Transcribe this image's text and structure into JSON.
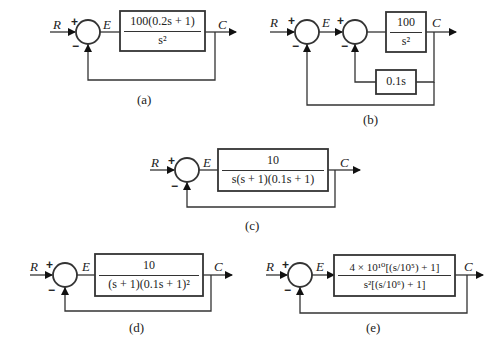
{
  "diagrams": [
    {
      "id": "a",
      "caption": "(a)",
      "input": "R",
      "error": "E",
      "output": "C",
      "plus": "+",
      "minus": "−",
      "forward": {
        "num": "100(0.2s + 1)",
        "den": "s²"
      }
    },
    {
      "id": "b",
      "caption": "(b)",
      "input": "R",
      "error": "E",
      "output": "C",
      "plus": "+",
      "minus": "−",
      "plus2": "+",
      "minus2": "−",
      "forward": {
        "num": "100",
        "den": "s²"
      },
      "feedback": "0.1s"
    },
    {
      "id": "c",
      "caption": "(c)",
      "input": "R",
      "error": "E",
      "output": "C",
      "plus": "+",
      "minus": "−",
      "forward": {
        "num": "10",
        "den": "s(s + 1)(0.1s + 1)"
      }
    },
    {
      "id": "d",
      "caption": "(d)",
      "input": "R",
      "error": "E",
      "output": "C",
      "plus": "+",
      "minus": "−",
      "forward": {
        "num": "10",
        "den": "(s + 1)(0.1s + 1)²"
      }
    },
    {
      "id": "e",
      "caption": "(e)",
      "input": "R",
      "error": "E",
      "output": "C",
      "plus": "+",
      "minus": "−",
      "forward": {
        "num": "4 × 10¹⁰[(s/10⁵) + 1]",
        "den": "s²[(s/10⁶) + 1]"
      }
    }
  ]
}
